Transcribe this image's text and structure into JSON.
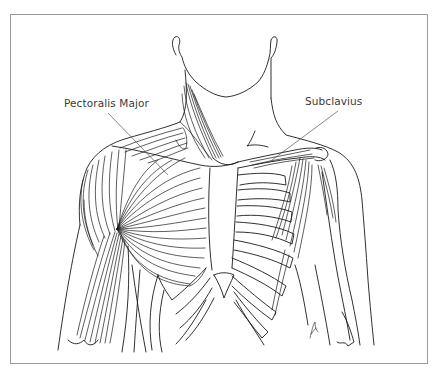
{
  "figure": {
    "labels": {
      "pectoralis_major": "Pectoralis Major",
      "subclavius": "Subclavius"
    },
    "colors": {
      "line": "#1a1a1a",
      "frame": "#9a9a9a",
      "leader": "#555555",
      "background": "#ffffff"
    }
  }
}
